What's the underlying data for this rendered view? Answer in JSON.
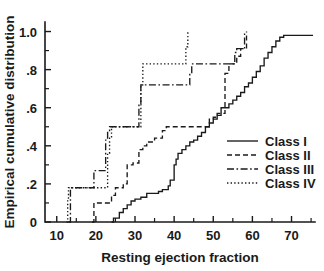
{
  "chart_data": {
    "type": "line",
    "title": "",
    "xlabel": "Resting ejection fraction",
    "ylabel": "Empirical cumulative distribution",
    "xlim": [
      7,
      76
    ],
    "ylim": [
      0,
      1.05
    ],
    "grid": false,
    "legend_position": "center-right",
    "xticks": [
      10,
      20,
      30,
      40,
      50,
      60,
      70
    ],
    "xtick_labels": [
      "10",
      "20",
      "30",
      "40",
      "50",
      "60",
      "70"
    ],
    "xticks_minor": [
      15,
      25,
      35,
      45,
      55,
      65,
      75
    ],
    "yticks": [
      0,
      0.2,
      0.4,
      0.6,
      0.8,
      1.0
    ],
    "ytick_labels": [
      "0",
      ".2",
      ".4",
      ".6",
      ".8",
      "1.0"
    ],
    "yticks_minor": [
      0.1,
      0.3,
      0.5,
      0.7,
      0.9
    ],
    "series": [
      {
        "name": "Class I",
        "dash": "none",
        "x": [
          24,
          24.5,
          26,
          27,
          28,
          29,
          30,
          31.5,
          33,
          35,
          36,
          37,
          38.5,
          39,
          40,
          40.5,
          41,
          42,
          43,
          44,
          45,
          46,
          47,
          48,
          49,
          50,
          51,
          52,
          53,
          54,
          55,
          56,
          57,
          58,
          59,
          60,
          61,
          62,
          63,
          64,
          65,
          66,
          67,
          68,
          75.5
        ],
        "y": [
          0.0,
          0.02,
          0.05,
          0.07,
          0.09,
          0.11,
          0.12,
          0.13,
          0.15,
          0.15,
          0.16,
          0.17,
          0.19,
          0.22,
          0.3,
          0.33,
          0.36,
          0.38,
          0.4,
          0.42,
          0.43,
          0.45,
          0.47,
          0.5,
          0.52,
          0.54,
          0.56,
          0.6,
          0.6,
          0.62,
          0.64,
          0.66,
          0.68,
          0.71,
          0.73,
          0.76,
          0.79,
          0.82,
          0.86,
          0.89,
          0.92,
          0.95,
          0.97,
          0.98,
          0.98
        ]
      },
      {
        "name": "Class II",
        "dash": "dashed",
        "x": [
          19,
          19.5,
          23,
          24,
          25,
          26,
          27,
          28,
          29.5,
          31,
          32,
          33,
          35,
          37,
          38,
          39,
          44,
          48,
          49,
          50,
          51,
          53,
          54,
          55,
          56,
          57,
          58,
          58.5
        ],
        "y": [
          0.0,
          0.1,
          0.1,
          0.14,
          0.18,
          0.18,
          0.2,
          0.3,
          0.31,
          0.38,
          0.4,
          0.42,
          0.44,
          0.48,
          0.5,
          0.5,
          0.5,
          0.5,
          0.54,
          0.55,
          0.57,
          0.78,
          0.83,
          0.83,
          0.87,
          0.91,
          0.91,
          1.0
        ]
      },
      {
        "name": "Class III",
        "dash": "dashdot",
        "x": [
          13,
          13.5,
          18,
          19,
          19.5,
          22,
          22.5,
          23,
          23.5,
          24,
          30.5,
          31,
          31.5,
          43.5,
          44,
          44.5,
          55,
          55.5,
          56,
          57.5,
          58
        ],
        "y": [
          0.0,
          0.18,
          0.18,
          0.18,
          0.27,
          0.27,
          0.43,
          0.47,
          0.5,
          0.5,
          0.5,
          0.62,
          0.72,
          0.72,
          0.78,
          0.83,
          0.83,
          0.89,
          0.91,
          0.91,
          1.0
        ]
      },
      {
        "name": "Class IV",
        "dash": "dotted",
        "x": [
          12.5,
          12.8,
          13,
          22,
          23,
          23.5,
          24,
          31,
          31.5,
          32,
          42.5,
          43,
          43.5
        ],
        "y": [
          0.0,
          0.12,
          0.18,
          0.18,
          0.36,
          0.44,
          0.5,
          0.5,
          0.72,
          0.83,
          0.83,
          0.92,
          1.0
        ]
      }
    ],
    "legend_entries": [
      {
        "label": "Class I",
        "dash": "none"
      },
      {
        "label": "Class II",
        "dash": "dashed"
      },
      {
        "label": "Class III",
        "dash": "dashdot"
      },
      {
        "label": "Class IV",
        "dash": "dotted"
      }
    ],
    "colors": {
      "ink": "#1a1a1a",
      "background": "#ffffff"
    }
  }
}
